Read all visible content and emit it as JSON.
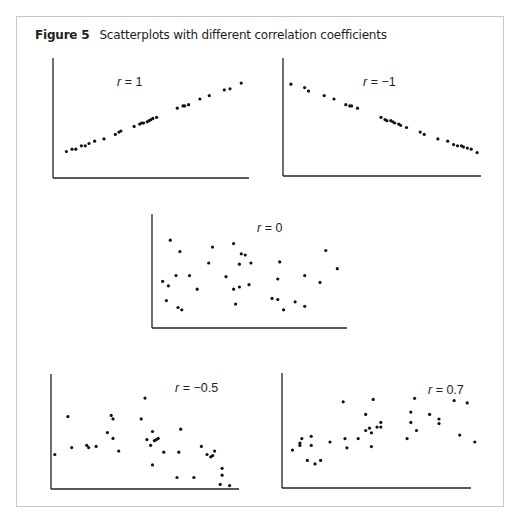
{
  "figure": {
    "label": "Figure 5",
    "caption": "Scatterplots with different correlation coefficients"
  },
  "chart_data": [
    {
      "type": "scatter",
      "title": "r = 1",
      "r_symbol": "r",
      "r_value": "= 1",
      "correlation": 1,
      "xlabel": "",
      "ylabel": "",
      "xlim": [
        0,
        100
      ],
      "ylim": [
        0,
        100
      ],
      "grid": false,
      "points": [
        [
          5,
          18
        ],
        [
          8,
          20
        ],
        [
          10,
          20
        ],
        [
          13,
          23
        ],
        [
          15,
          23
        ],
        [
          17,
          25
        ],
        [
          20,
          27
        ],
        [
          25,
          29
        ],
        [
          31,
          33
        ],
        [
          33,
          35
        ],
        [
          34,
          36
        ],
        [
          41,
          40
        ],
        [
          44,
          42
        ],
        [
          45,
          43
        ],
        [
          46,
          43
        ],
        [
          48,
          44
        ],
        [
          49,
          45
        ],
        [
          50,
          46
        ],
        [
          51,
          47
        ],
        [
          53,
          48
        ],
        [
          64,
          56
        ],
        [
          67,
          58
        ],
        [
          68,
          58
        ],
        [
          70,
          59
        ],
        [
          76,
          64
        ],
        [
          81,
          67
        ],
        [
          89,
          72
        ],
        [
          92,
          73
        ],
        [
          98,
          78
        ]
      ]
    },
    {
      "type": "scatter",
      "title": "r = −1",
      "r_symbol": "r",
      "r_value": "= −1",
      "correlation": -1,
      "xlabel": "",
      "ylabel": "",
      "xlim": [
        0,
        100
      ],
      "ylim": [
        0,
        100
      ],
      "grid": false,
      "points": [
        [
          3,
          77
        ],
        [
          10,
          74
        ],
        [
          12,
          71
        ],
        [
          20,
          67
        ],
        [
          25,
          64
        ],
        [
          31,
          59
        ],
        [
          33,
          58
        ],
        [
          34,
          58
        ],
        [
          37,
          56
        ],
        [
          49,
          48
        ],
        [
          51,
          46
        ],
        [
          52,
          45
        ],
        [
          54,
          45
        ],
        [
          55,
          44
        ],
        [
          56,
          43
        ],
        [
          58,
          42
        ],
        [
          59,
          41
        ],
        [
          62,
          39
        ],
        [
          69,
          35
        ],
        [
          71,
          33
        ],
        [
          78,
          29
        ],
        [
          83,
          27
        ],
        [
          86,
          24
        ],
        [
          88,
          23
        ],
        [
          90,
          23
        ],
        [
          91,
          22
        ],
        [
          93,
          21
        ],
        [
          95,
          20
        ],
        [
          98,
          17
        ]
      ]
    },
    {
      "type": "scatter",
      "title": "r = 0",
      "r_symbol": "r",
      "r_value": "= 0",
      "correlation": 0,
      "xlabel": "",
      "ylabel": "",
      "xlim": [
        0,
        100
      ],
      "ylim": [
        0,
        100
      ],
      "grid": false,
      "points": [
        [
          9,
          77
        ],
        [
          14,
          67
        ],
        [
          5,
          41
        ],
        [
          8,
          37
        ],
        [
          12,
          46
        ],
        [
          19,
          46
        ],
        [
          23,
          34
        ],
        [
          7,
          24
        ],
        [
          13,
          18
        ],
        [
          15,
          16
        ],
        [
          31,
          71
        ],
        [
          29,
          57
        ],
        [
          42,
          74
        ],
        [
          46,
          65
        ],
        [
          48,
          64
        ],
        [
          45,
          56
        ],
        [
          51,
          57
        ],
        [
          38,
          45
        ],
        [
          42,
          34
        ],
        [
          45,
          36
        ],
        [
          50,
          38
        ],
        [
          43,
          21
        ],
        [
          66,
          58
        ],
        [
          65,
          43
        ],
        [
          62,
          26
        ],
        [
          65,
          25
        ],
        [
          68,
          16
        ],
        [
          74,
          23
        ],
        [
          79,
          19
        ],
        [
          79,
          46
        ],
        [
          87,
          40
        ],
        [
          90,
          68
        ],
        [
          96,
          52
        ]
      ]
    },
    {
      "type": "scatter",
      "title": "r = −0.5",
      "r_symbol": "r",
      "r_value": "= −0.5",
      "correlation": -0.5,
      "xlabel": "",
      "ylabel": "",
      "xlim": [
        0,
        100
      ],
      "ylim": [
        0,
        100
      ],
      "grid": false,
      "points": [
        [
          2,
          30
        ],
        [
          9,
          63
        ],
        [
          11,
          36
        ],
        [
          19,
          38
        ],
        [
          20,
          36
        ],
        [
          24,
          37
        ],
        [
          30,
          49
        ],
        [
          32,
          64
        ],
        [
          33,
          61
        ],
        [
          33,
          44
        ],
        [
          36,
          33
        ],
        [
          48,
          61
        ],
        [
          50,
          79
        ],
        [
          54,
          50
        ],
        [
          51,
          43
        ],
        [
          53,
          38
        ],
        [
          55,
          42
        ],
        [
          56,
          43
        ],
        [
          57,
          44
        ],
        [
          54,
          21
        ],
        [
          60,
          32
        ],
        [
          67,
          10
        ],
        [
          68,
          32
        ],
        [
          69,
          52
        ],
        [
          76,
          10
        ],
        [
          80,
          37
        ],
        [
          83,
          30
        ],
        [
          85,
          28
        ],
        [
          86,
          29
        ],
        [
          87,
          33
        ],
        [
          91,
          18
        ],
        [
          91,
          12
        ],
        [
          90,
          4
        ],
        [
          95,
          3
        ]
      ]
    },
    {
      "type": "scatter",
      "title": "r = 0.7",
      "r_symbol": "r",
      "r_value": "= 0.7",
      "correlation": 0.7,
      "xlabel": "",
      "ylabel": "",
      "xlim": [
        0,
        100
      ],
      "ylim": [
        0,
        100
      ],
      "grid": false,
      "points": [
        [
          5,
          33
        ],
        [
          9,
          37
        ],
        [
          9,
          39
        ],
        [
          10,
          43
        ],
        [
          13,
          24
        ],
        [
          15,
          45
        ],
        [
          15,
          37
        ],
        [
          17,
          21
        ],
        [
          20,
          24
        ],
        [
          25,
          40
        ],
        [
          32,
          75
        ],
        [
          33,
          43
        ],
        [
          34,
          35
        ],
        [
          40,
          43
        ],
        [
          44,
          64
        ],
        [
          44,
          50
        ],
        [
          46,
          52
        ],
        [
          47,
          48
        ],
        [
          47,
          36
        ],
        [
          48,
          77
        ],
        [
          50,
          53
        ],
        [
          52,
          57
        ],
        [
          52,
          53
        ],
        [
          66,
          43
        ],
        [
          68,
          66
        ],
        [
          68,
          57
        ],
        [
          70,
          78
        ],
        [
          71,
          50
        ],
        [
          78,
          64
        ],
        [
          83,
          60
        ],
        [
          83,
          56
        ],
        [
          91,
          76
        ],
        [
          94,
          46
        ],
        [
          98,
          74
        ],
        [
          102,
          40
        ]
      ]
    }
  ]
}
